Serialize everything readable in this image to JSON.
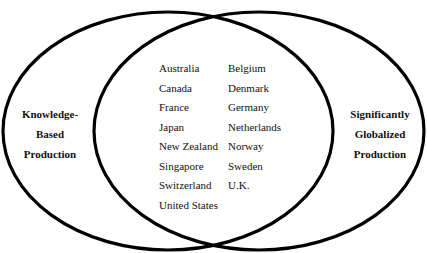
{
  "diagram": {
    "type": "venn",
    "stroke_color": "#000000",
    "background_color": "#ffffff",
    "sets": [
      {
        "id": "left",
        "label_lines": [
          "Knowledge-",
          "Based",
          "Production"
        ]
      },
      {
        "id": "right",
        "label_lines": [
          "Significantly",
          "Globalized",
          "Production"
        ]
      }
    ],
    "intersection": {
      "left_column": [
        "Australia",
        "Canada",
        "France",
        "Japan",
        "New Zealand",
        "Singapore",
        "Switzerland",
        "United States"
      ],
      "right_column": [
        "Belgium",
        "Denmark",
        "Germany",
        "Netherlands",
        "Norway",
        "Sweden",
        "U.K."
      ]
    }
  }
}
